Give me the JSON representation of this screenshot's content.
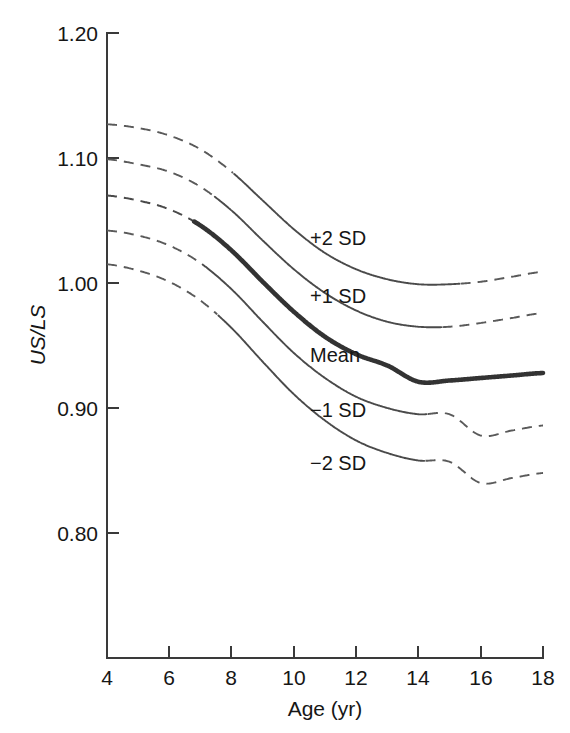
{
  "chart_data": {
    "type": "line",
    "title": "",
    "xlabel": "Age (yr)",
    "ylabel": "US/LS",
    "xlim": [
      4,
      18
    ],
    "ylim": [
      0.745,
      1.2
    ],
    "xticks": [
      4,
      6,
      8,
      10,
      12,
      14,
      16,
      18
    ],
    "xtick_labels": [
      "4",
      "6",
      "8",
      "10",
      "12",
      "14",
      "16",
      "18"
    ],
    "yticks": [
      0.8,
      0.9,
      1.0,
      1.1,
      1.2
    ],
    "ytick_labels": [
      "0.80",
      "0.90",
      "1.00",
      "1.10",
      "1.20"
    ],
    "grid": false,
    "legend": "inline-curve-labels",
    "x": [
      4,
      5,
      6,
      7,
      8,
      9,
      10,
      11,
      12,
      13,
      14,
      15,
      16,
      17,
      18
    ],
    "series": [
      {
        "name": "+2 SD",
        "label": "+2 SD",
        "style": "thin",
        "values": [
          1.127,
          1.124,
          1.118,
          1.107,
          1.089,
          1.066,
          1.043,
          1.024,
          1.011,
          1.003,
          0.999,
          0.999,
          1.001,
          1.005,
          1.009
        ]
      },
      {
        "name": "+1 SD",
        "label": "+1 SD",
        "style": "thin",
        "values": [
          1.099,
          1.095,
          1.089,
          1.077,
          1.058,
          1.034,
          1.011,
          0.992,
          0.978,
          0.969,
          0.965,
          0.965,
          0.968,
          0.972,
          0.976
        ]
      },
      {
        "name": "Mean",
        "label": "Mean",
        "style": "thick",
        "values": [
          1.07,
          1.066,
          1.059,
          1.046,
          1.026,
          1.001,
          0.977,
          0.957,
          0.943,
          0.934,
          0.921,
          0.922,
          0.924,
          0.926,
          0.928
        ]
      },
      {
        "name": "-1 SD",
        "label": "−1 SD",
        "style": "thin",
        "values": [
          1.042,
          1.038,
          1.03,
          1.016,
          0.995,
          0.969,
          0.944,
          0.924,
          0.909,
          0.9,
          0.895,
          0.895,
          0.878,
          0.882,
          0.886
        ]
      },
      {
        "name": "-2 SD",
        "label": "−2 SD",
        "style": "thin",
        "values": [
          1.015,
          1.01,
          1.001,
          0.986,
          0.964,
          0.937,
          0.911,
          0.89,
          0.874,
          0.864,
          0.858,
          0.857,
          0.84,
          0.844,
          0.848
        ]
      }
    ],
    "annotations": [
      {
        "text": "+2 SD",
        "x": 10.55,
        "y": 1.043
      },
      {
        "text": "+1 SD",
        "x": 10.55,
        "y": 0.997
      },
      {
        "text": "Mean",
        "x": 10.55,
        "y": 0.95
      },
      {
        "text": "−1 SD",
        "x": 10.55,
        "y": 0.906
      },
      {
        "text": "−2 SD",
        "x": 10.55,
        "y": 0.863
      }
    ]
  },
  "axes": {
    "y_axis_name": "US/LS",
    "x_axis_name": "Age (yr)"
  }
}
